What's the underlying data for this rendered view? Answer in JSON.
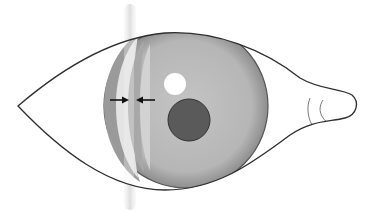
{
  "diagram": {
    "colors": {
      "background": "#ffffff",
      "outline": "#3a3a3a",
      "sclera": "#ffffff",
      "iris": "#b8b8b8",
      "iris_edge": "#7a7a7a",
      "iris_band_dark": "#8c8c8c",
      "iris_band_light": "#d8d8d8",
      "pupil": "#5a5a5a",
      "highlight": "#ffffff",
      "slit_beam": "#e2e2e2",
      "arrow": "#111111"
    },
    "elements": [
      {
        "name": "eyelid-outline"
      },
      {
        "name": "iris"
      },
      {
        "name": "pupil"
      },
      {
        "name": "corneal-highlight"
      },
      {
        "name": "slit-lamp-beam"
      },
      {
        "name": "arrow-right"
      },
      {
        "name": "arrow-left"
      },
      {
        "name": "caruncle"
      }
    ]
  }
}
